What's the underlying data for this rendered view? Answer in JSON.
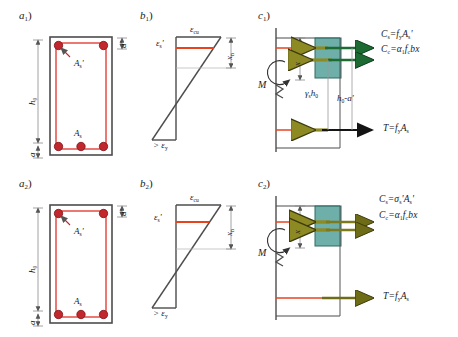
{
  "figure": {
    "colors": {
      "rebar": "#c1272d",
      "stirrup": "#e03127",
      "outline": "#4d4d4d",
      "concrete_block": "#4f9e96",
      "block_stroke": "#2f6b63",
      "arrow_olive": "#7d7a1e",
      "arrow_green": "#1f6b2f",
      "dimension": "#8c8c8c",
      "neutral_axis_line": "#e8431f",
      "text": "#1a1a1a"
    }
  },
  "row1": {
    "a": {
      "tag": "a",
      "tag_sub": "1",
      "tag_paren": ")",
      "labels": {
        "h0": "h",
        "h0_sub": "0",
        "a": "a",
        "d_prime": "d'",
        "as_top": "A",
        "as_top_sub": "s",
        "as_top_prime": "'",
        "as_bot": "A",
        "as_bot_sub": "s"
      },
      "rebar_top_count": 2,
      "rebar_bottom_count": 3
    },
    "b": {
      "tag": "b",
      "tag_sub": "1",
      "tag_paren": ")",
      "labels": {
        "ecu": "ε",
        "ecu_sub": "cu",
        "es_prime": "ε",
        "es_prime_sub": "s",
        "es_prime_mark": "'",
        "xn": "x",
        "xn_sub": "n",
        "ey": "> ε",
        "ey_sub": "y"
      },
      "xn_depth_ratio": 0.3
    },
    "c": {
      "tag": "c",
      "tag_sub": "1",
      "tag_paren": ")",
      "labels": {
        "moment": "M",
        "x_dim": "x",
        "gamma_h0": "γ",
        "gamma_h0_sub": "s",
        "gamma_h0_rest": "h",
        "gamma_h0_rest_sub": "0",
        "h0_minus_a": "h",
        "h0_minus_a_sub": "0",
        "h0_minus_a_rest": "-a'"
      },
      "equations": {
        "cs": "Cₛ = fᵧ Aₛ'",
        "cs_parts": {
          "lhs": "C",
          "lhs_sub": "s",
          "eq": "=",
          "f": "f",
          "f_sub": "y",
          "a": "A",
          "a_sub": "s",
          "prime": "'"
        },
        "cc_parts": {
          "lhs": "C",
          "lhs_sub": "c",
          "eq": "=",
          "alpha": "α",
          "alpha_sub": "1",
          "f": "f",
          "f_sub": "c",
          "b": "bx"
        },
        "t_parts": {
          "lhs": "T",
          "eq": "=",
          "f": "f",
          "f_sub": "y",
          "a": "A",
          "a_sub": "s"
        }
      }
    }
  },
  "row2": {
    "a": {
      "tag": "a",
      "tag_sub": "2",
      "tag_paren": ")",
      "labels": {
        "h0": "h",
        "h0_sub": "0",
        "a": "a",
        "d_prime": "d'",
        "as_top": "A",
        "as_top_sub": "s",
        "as_top_prime": "'",
        "as_bot": "A",
        "as_bot_sub": "s"
      },
      "rebar_top_count": 2,
      "rebar_bottom_count": 3
    },
    "b": {
      "tag": "b",
      "tag_sub": "2",
      "tag_paren": ")",
      "labels": {
        "ecu": "ε",
        "ecu_sub": "cu",
        "es_prime": "ε",
        "es_prime_sub": "s",
        "es_prime_mark": "'",
        "xn": "x",
        "xn_sub": "n",
        "ey": "> ε",
        "ey_sub": "y"
      },
      "xn_depth_ratio": 0.42
    },
    "c": {
      "tag": "c",
      "tag_sub": "2",
      "tag_paren": ")",
      "labels": {
        "moment": "M",
        "x_dim": "x"
      },
      "equations": {
        "cs_parts": {
          "lhs": "C",
          "lhs_sub": "s",
          "eq": "=",
          "sigma": "σ",
          "sigma_sub": "s",
          "sigma_prime": "'",
          "a": "A",
          "a_sub": "s",
          "prime": "'"
        },
        "cc_parts": {
          "lhs": "C",
          "lhs_sub": "c",
          "eq": "=",
          "alpha": "α",
          "alpha_sub": "1",
          "f": "f",
          "f_sub": "c",
          "b": "bx"
        },
        "t_parts": {
          "lhs": "T",
          "eq": "=",
          "f": "f",
          "f_sub": "y",
          "a": "A",
          "a_sub": "s"
        }
      }
    }
  }
}
